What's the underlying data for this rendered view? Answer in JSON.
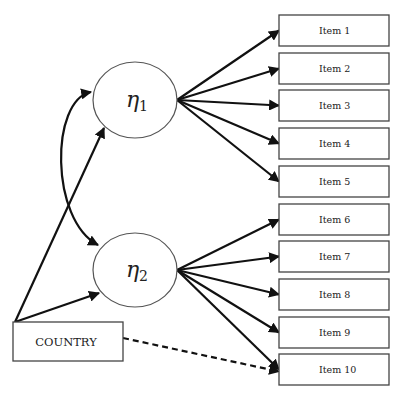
{
  "diagram": {
    "type": "structural-equation-model",
    "latent_factors": [
      {
        "id": "eta1",
        "symbol": "η",
        "subscript": "1",
        "cx": 135,
        "cy": 100,
        "rx": 42,
        "ry": 38
      },
      {
        "id": "eta2",
        "symbol": "η",
        "subscript": "2",
        "cx": 135,
        "cy": 270,
        "rx": 42,
        "ry": 37
      }
    ],
    "covariate": {
      "label": "COUNTRY",
      "x": 13,
      "y": 322,
      "w": 110,
      "h": 39
    },
    "items": [
      {
        "label": "Item 1",
        "y": 15
      },
      {
        "label": "Item 2",
        "y": 53
      },
      {
        "label": "Item 3",
        "y": 90
      },
      {
        "label": "Item 4",
        "y": 128
      },
      {
        "label": "Item 5",
        "y": 166
      },
      {
        "label": "Item 6",
        "y": 204
      },
      {
        "label": "Item 7",
        "y": 241
      },
      {
        "label": "Item 8",
        "y": 279
      },
      {
        "label": "Item 9",
        "y": 317
      },
      {
        "label": "Item 10",
        "y": 354
      }
    ],
    "item_box": {
      "x": 279,
      "w": 110,
      "h": 31
    },
    "edges": [
      {
        "from": "COUNTRY",
        "to": "eta1",
        "style": "solid"
      },
      {
        "from": "COUNTRY",
        "to": "eta2",
        "style": "solid"
      },
      {
        "from": "eta1",
        "to": "eta2",
        "style": "solid-curved-covariance"
      },
      {
        "from": "eta1",
        "to": [
          "Item 1",
          "Item 2",
          "Item 3",
          "Item 4",
          "Item 5"
        ],
        "style": "solid"
      },
      {
        "from": "eta2",
        "to": [
          "Item 6",
          "Item 7",
          "Item 8",
          "Item 9",
          "Item 10"
        ],
        "style": "solid"
      },
      {
        "from": "COUNTRY",
        "to": "Item 10",
        "style": "dashed"
      }
    ],
    "colors": {
      "stroke": "#111111",
      "box_border": "#444444",
      "fill": "#ffffff",
      "text": "#222222"
    }
  }
}
